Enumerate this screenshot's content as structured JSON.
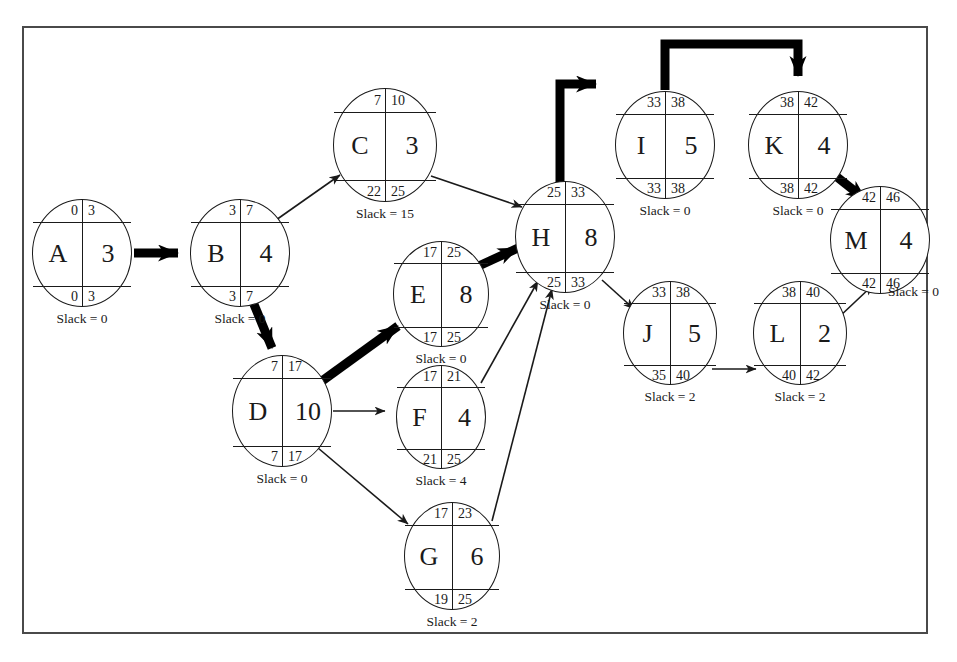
{
  "diagram": {
    "type": "activity-on-node-network",
    "slack_label_prefix": "Slack = ",
    "colors": {
      "frame": "#4a4a4a",
      "node_stroke": "#1a1a1a",
      "node_fill": "#ffffff",
      "edge": "#1a1a1a",
      "critical_edge": "#000000",
      "background": "#ffffff"
    },
    "nodes": [
      {
        "id": "A",
        "activity": "A",
        "duration": "3",
        "es": "0",
        "ef": "3",
        "ls": "0",
        "lf": "3",
        "slack": "Slack = 0",
        "critical": true,
        "cx": 82,
        "cy": 253,
        "rx": 50,
        "ry": 54
      },
      {
        "id": "B",
        "activity": "B",
        "duration": "4",
        "es": "3",
        "ef": "7",
        "ls": "3",
        "lf": "7",
        "slack": "Slack = 0",
        "critical": true,
        "cx": 240,
        "cy": 253,
        "rx": 50,
        "ry": 54
      },
      {
        "id": "C",
        "activity": "C",
        "duration": "3",
        "es": "7",
        "ef": "10",
        "ls": "22",
        "lf": "25",
        "slack": "Slack = 15",
        "critical": false,
        "cx": 385,
        "cy": 145,
        "rx": 52,
        "ry": 57
      },
      {
        "id": "D",
        "activity": "D",
        "duration": "10",
        "es": "7",
        "ef": "17",
        "ls": "7",
        "lf": "17",
        "slack": "Slack = 0",
        "critical": true,
        "cx": 282,
        "cy": 411,
        "rx": 50,
        "ry": 56
      },
      {
        "id": "E",
        "activity": "E",
        "duration": "8",
        "es": "17",
        "ef": "25",
        "ls": "17",
        "lf": "25",
        "slack": "Slack = 0",
        "critical": true,
        "cx": 441,
        "cy": 294,
        "rx": 48,
        "ry": 53
      },
      {
        "id": "F",
        "activity": "F",
        "duration": "4",
        "es": "17",
        "ef": "21",
        "ls": "21",
        "lf": "25",
        "slack": "Slack = 4",
        "critical": false,
        "cx": 441,
        "cy": 417,
        "rx": 45,
        "ry": 52
      },
      {
        "id": "G",
        "activity": "G",
        "duration": "6",
        "es": "17",
        "ef": "23",
        "ls": "19",
        "lf": "25",
        "slack": "Slack = 2",
        "critical": false,
        "cx": 452,
        "cy": 556,
        "rx": 48,
        "ry": 54
      },
      {
        "id": "H",
        "activity": "H",
        "duration": "8",
        "es": "25",
        "ef": "33",
        "ls": "25",
        "lf": "33",
        "slack": "Slack = 0",
        "critical": true,
        "cx": 565,
        "cy": 237,
        "rx": 50,
        "ry": 56
      },
      {
        "id": "I",
        "activity": "I",
        "duration": "5",
        "es": "33",
        "ef": "38",
        "ls": "33",
        "lf": "38",
        "slack": "Slack = 0",
        "critical": true,
        "cx": 665,
        "cy": 145,
        "rx": 50,
        "ry": 54
      },
      {
        "id": "J",
        "activity": "J",
        "duration": "5",
        "es": "33",
        "ef": "38",
        "ls": "35",
        "lf": "40",
        "slack": "Slack = 2",
        "critical": false,
        "cx": 670,
        "cy": 333,
        "rx": 47,
        "ry": 52
      },
      {
        "id": "K",
        "activity": "K",
        "duration": "4",
        "es": "38",
        "ef": "42",
        "ls": "38",
        "lf": "42",
        "slack": "Slack = 0",
        "critical": true,
        "cx": 798,
        "cy": 145,
        "rx": 50,
        "ry": 54
      },
      {
        "id": "L",
        "activity": "L",
        "duration": "2",
        "es": "38",
        "ef": "40",
        "ls": "40",
        "lf": "42",
        "slack": "Slack = 2",
        "critical": false,
        "cx": 800,
        "cy": 333,
        "rx": 47,
        "ry": 52
      },
      {
        "id": "M",
        "activity": "M",
        "duration": "4",
        "es": "42",
        "ef": "46",
        "ls": "42",
        "lf": "46",
        "slack": "Slack = 0",
        "critical": true,
        "cx": 880,
        "cy": 240,
        "rx": 50,
        "ry": 54
      }
    ],
    "edges": [
      {
        "from": "A",
        "to": "B",
        "critical": true
      },
      {
        "from": "B",
        "to": "C",
        "critical": false
      },
      {
        "from": "B",
        "to": "D",
        "critical": true
      },
      {
        "from": "C",
        "to": "H",
        "critical": false
      },
      {
        "from": "D",
        "to": "E",
        "critical": true
      },
      {
        "from": "D",
        "to": "F",
        "critical": false
      },
      {
        "from": "D",
        "to": "G",
        "critical": false
      },
      {
        "from": "E",
        "to": "H",
        "critical": true
      },
      {
        "from": "F",
        "to": "H",
        "critical": false
      },
      {
        "from": "G",
        "to": "H",
        "critical": false
      },
      {
        "from": "H",
        "to": "I",
        "critical": true
      },
      {
        "from": "H",
        "to": "J",
        "critical": false
      },
      {
        "from": "I",
        "to": "K",
        "critical": true
      },
      {
        "from": "J",
        "to": "L",
        "critical": false
      },
      {
        "from": "K",
        "to": "M",
        "critical": true
      },
      {
        "from": "L",
        "to": "M",
        "critical": false
      }
    ],
    "critical_path": [
      "A",
      "B",
      "D",
      "E",
      "H",
      "I",
      "K",
      "M"
    ],
    "project_duration": "46"
  }
}
